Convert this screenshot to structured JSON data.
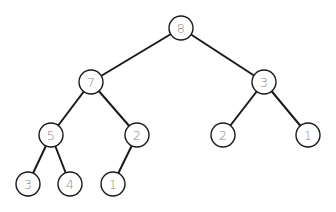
{
  "diagram": {
    "type": "binary-tree",
    "node_radius": 12,
    "nodes": [
      {
        "id": "n0",
        "label": "8",
        "x": 181,
        "y": 28
      },
      {
        "id": "n1",
        "label": "7",
        "x": 91,
        "y": 82
      },
      {
        "id": "n2",
        "label": "3",
        "x": 264,
        "y": 82
      },
      {
        "id": "n3",
        "label": "5",
        "x": 51,
        "y": 135
      },
      {
        "id": "n4",
        "label": "2",
        "x": 137,
        "y": 135
      },
      {
        "id": "n5",
        "label": "2",
        "x": 223,
        "y": 135
      },
      {
        "id": "n6",
        "label": "1",
        "x": 308,
        "y": 135
      },
      {
        "id": "n7",
        "label": "3",
        "x": 28,
        "y": 184
      },
      {
        "id": "n8",
        "label": "4",
        "x": 70,
        "y": 184
      },
      {
        "id": "n9",
        "label": "1",
        "x": 113,
        "y": 184
      }
    ],
    "edges": [
      {
        "from": "n0",
        "to": "n1"
      },
      {
        "from": "n0",
        "to": "n2"
      },
      {
        "from": "n1",
        "to": "n3"
      },
      {
        "from": "n1",
        "to": "n4"
      },
      {
        "from": "n2",
        "to": "n5"
      },
      {
        "from": "n2",
        "to": "n6"
      },
      {
        "from": "n3",
        "to": "n7"
      },
      {
        "from": "n3",
        "to": "n8"
      },
      {
        "from": "n4",
        "to": "n9"
      }
    ]
  }
}
